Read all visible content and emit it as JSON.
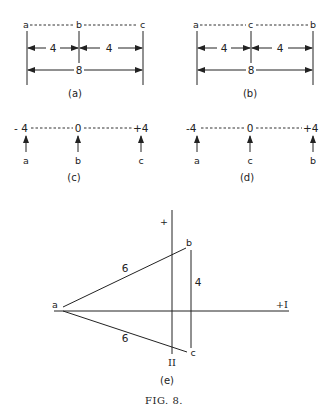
{
  "figure": {
    "caption": "FIG. 8.",
    "panel_a": {
      "caption": "(a)",
      "points": [
        "a",
        "b",
        "c"
      ],
      "segment_left": "4",
      "segment_right": "4",
      "total": "8"
    },
    "panel_b": {
      "caption": "(b)",
      "points": [
        "a",
        "c",
        "b"
      ],
      "segment_left": "4",
      "segment_right": "4",
      "total": "8"
    },
    "panel_c": {
      "caption": "(c)",
      "scale": [
        "- 4",
        "0",
        "+4"
      ],
      "arrows": [
        "a",
        "b",
        "c"
      ]
    },
    "panel_d": {
      "caption": "(d)",
      "scale": [
        "-4",
        "0",
        "+4"
      ],
      "arrows": [
        "a",
        "c",
        "b"
      ]
    },
    "panel_e": {
      "caption": "(e)",
      "axis_x_label": "+I",
      "axis_y_label": "+",
      "axis_y_bottom_label": "II",
      "points": [
        "a",
        "b",
        "c"
      ],
      "ab_length": "6",
      "ac_length": "6",
      "bc_length": "4"
    }
  }
}
